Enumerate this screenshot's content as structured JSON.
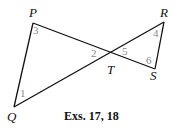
{
  "diagram": {
    "points": {
      "P": {
        "label": "P",
        "x": 33,
        "y": 23
      },
      "Q": {
        "label": "Q",
        "x": 14,
        "y": 107
      },
      "T": {
        "label": "T",
        "x": 111,
        "y": 60
      },
      "R": {
        "label": "R",
        "x": 164,
        "y": 22
      },
      "S": {
        "label": "S",
        "x": 155,
        "y": 69
      }
    },
    "segments": [
      [
        "P",
        "Q"
      ],
      [
        "P",
        "S"
      ],
      [
        "Q",
        "R"
      ],
      [
        "R",
        "S"
      ]
    ],
    "angles": {
      "a1": "1",
      "a2": "2",
      "a3": "3",
      "a4": "4",
      "a5": "5",
      "a6": "6"
    },
    "caption": "Exs. 17, 18"
  }
}
